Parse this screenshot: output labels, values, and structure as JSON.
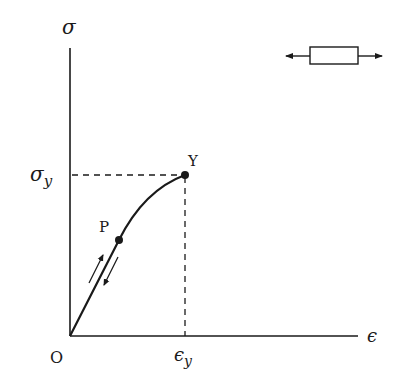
{
  "diagram": {
    "axes": {
      "y_label": "σ",
      "x_label": "ϵ",
      "origin_label": "O",
      "y_tick_label": "σ",
      "y_tick_sub": "y",
      "x_tick_label": "ϵ",
      "x_tick_sub": "y"
    },
    "points": [
      {
        "id": "P",
        "label": "P",
        "description": "proportional limit"
      },
      {
        "id": "Y",
        "label": "Y",
        "description": "yield point"
      }
    ],
    "annotations": {
      "loading_arrows": "loading / unloading along linear segment",
      "specimen_icon": "bar under tension (arrows pointing outward)"
    },
    "colors": {
      "ink": "#1a1a1a",
      "background": "#ffffff"
    }
  }
}
